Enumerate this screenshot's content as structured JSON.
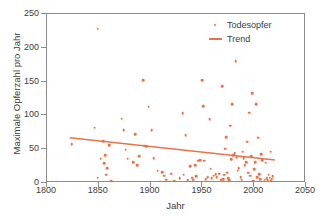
{
  "chart_data": {
    "type": "scatter",
    "title": "",
    "xlabel": "Jahr",
    "ylabel": "Maximale Opferzahl pro Jahr",
    "xlim": [
      1800,
      2050
    ],
    "ylim": [
      0,
      250
    ],
    "xticks": [
      1800,
      1850,
      1900,
      1950,
      2000,
      2050
    ],
    "yticks": [
      0,
      50,
      100,
      150,
      200,
      250
    ],
    "grid": false,
    "legend_position": "top-right",
    "marker_color": "#e8734a",
    "trend_color": "#e8734a",
    "series": [
      {
        "name": "Todesopfer",
        "type": "scatter",
        "points": [
          [
            1824,
            57
          ],
          [
            1846,
            82
          ],
          [
            1849,
            228
          ],
          [
            1849,
            8
          ],
          [
            1852,
            36
          ],
          [
            1854,
            62
          ],
          [
            1855,
            29
          ],
          [
            1856,
            41
          ],
          [
            1857,
            12
          ],
          [
            1858,
            22
          ],
          [
            1860,
            56
          ],
          [
            1862,
            3
          ],
          [
            1872,
            95
          ],
          [
            1874,
            78
          ],
          [
            1876,
            49
          ],
          [
            1878,
            36
          ],
          [
            1883,
            31
          ],
          [
            1885,
            72
          ],
          [
            1887,
            26
          ],
          [
            1889,
            40
          ],
          [
            1893,
            152
          ],
          [
            1894,
            55
          ],
          [
            1896,
            54
          ],
          [
            1898,
            113
          ],
          [
            1901,
            78
          ],
          [
            1903,
            37
          ],
          [
            1907,
            18
          ],
          [
            1909,
            2
          ],
          [
            1911,
            16
          ],
          [
            1913,
            11
          ],
          [
            1915,
            5
          ],
          [
            1918,
            2
          ],
          [
            1920,
            14
          ],
          [
            1923,
            3
          ],
          [
            1928,
            7
          ],
          [
            1931,
            103
          ],
          [
            1932,
            12
          ],
          [
            1934,
            71
          ],
          [
            1936,
            4
          ],
          [
            1938,
            25
          ],
          [
            1940,
            8
          ],
          [
            1941,
            5
          ],
          [
            1943,
            26
          ],
          [
            1944,
            10
          ],
          [
            1946,
            33
          ],
          [
            1948,
            34
          ],
          [
            1950,
            152
          ],
          [
            1951,
            114
          ],
          [
            1952,
            33
          ],
          [
            1953,
            6
          ],
          [
            1955,
            9
          ],
          [
            1957,
            94
          ],
          [
            1958,
            21
          ],
          [
            1959,
            7
          ],
          [
            1961,
            11
          ],
          [
            1963,
            13
          ],
          [
            1964,
            9
          ],
          [
            1966,
            14
          ],
          [
            1968,
            5
          ],
          [
            1969,
            143
          ],
          [
            1970,
            6
          ],
          [
            1971,
            12
          ],
          [
            1972,
            51
          ],
          [
            1973,
            68
          ],
          [
            1974,
            15
          ],
          [
            1975,
            7
          ],
          [
            1976,
            4
          ],
          [
            1977,
            85
          ],
          [
            1978,
            35
          ],
          [
            1979,
            117
          ],
          [
            1980,
            41
          ],
          [
            1981,
            44
          ],
          [
            1982,
            180
          ],
          [
            1983,
            38
          ],
          [
            1984,
            18
          ],
          [
            1985,
            22
          ],
          [
            1986,
            2
          ],
          [
            1987,
            9
          ],
          [
            1988,
            5
          ],
          [
            1989,
            46
          ],
          [
            1990,
            37
          ],
          [
            1991,
            26
          ],
          [
            1992,
            31
          ],
          [
            1993,
            61
          ],
          [
            1994,
            15
          ],
          [
            1995,
            104
          ],
          [
            1996,
            11
          ],
          [
            1997,
            40
          ],
          [
            1998,
            133
          ],
          [
            1999,
            3
          ],
          [
            2000,
            20
          ],
          [
            2001,
            31
          ],
          [
            2002,
            117
          ],
          [
            2003,
            9
          ],
          [
            2004,
            67
          ],
          [
            2005,
            13
          ],
          [
            2006,
            6
          ],
          [
            2007,
            43
          ],
          [
            2008,
            34
          ],
          [
            2009,
            2
          ],
          [
            2010,
            5
          ],
          [
            2011,
            30
          ],
          [
            2012,
            7
          ],
          [
            2013,
            4
          ],
          [
            2014,
            12
          ],
          [
            2015,
            8
          ],
          [
            2016,
            46
          ],
          [
            2016,
            3
          ],
          [
            2017,
            6
          ],
          [
            2018,
            10
          ],
          [
            2019,
            2
          ]
        ]
      },
      {
        "name": "Trend",
        "type": "line",
        "points": [
          [
            1822,
            67
          ],
          [
            2020,
            34
          ]
        ]
      }
    ]
  },
  "legend": {
    "items": [
      {
        "label": "Todesopfer",
        "marker": "dot-marker",
        "color": "#e8734a"
      },
      {
        "label": "Trend",
        "marker": "line-marker",
        "color": "#e8734a"
      }
    ]
  }
}
